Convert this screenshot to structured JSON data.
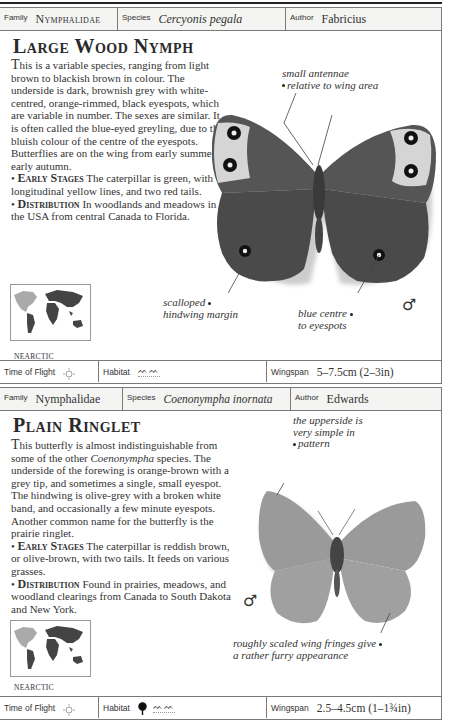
{
  "entries": [
    {
      "header": {
        "family_label": "Family",
        "family_value": "Nymphalidae",
        "species_label": "Species",
        "species_value": "Cercyonis pegala",
        "author_label": "Author",
        "author_value": "Fabricius"
      },
      "title": "Large Wood Nymph",
      "description": {
        "dropcap": "T",
        "text": "his is a variable species, ranging from light brown to blackish brown in colour. The underside is dark, brownish grey with white-centred, orange-rimmed, black eyespots, which are variable in number. The sexes are similar. It is often called the blue-eyed greyling, due to the bluish colour of the centre of the eyespots. Butterflies are on the wing from early summer to early autumn.",
        "early_stages_heading": "Early Stages",
        "early_stages_text": "The caterpillar is green, with longitudinal yellow lines, and two red tails.",
        "distribution_heading": "Distribution",
        "distribution_text": "In woodlands and meadows in the USA from central Canada to Florida."
      },
      "annotations": [
        {
          "text_line1": "small antennae",
          "text_line2": "relative to wing area"
        },
        {
          "text_line1": "scalloped",
          "text_line2": "hindwing margin"
        },
        {
          "text_line1": "blue centre",
          "text_line2": "to eyespots"
        }
      ],
      "sex_symbol": "♂",
      "map_region": "NEARCTIC",
      "footer": {
        "time_of_flight_label": "Time of Flight",
        "time_of_flight_icon": "sun-icon",
        "habitat_label": "Habitat",
        "habitat_icons": [
          "grassland-icon"
        ],
        "wingspan_label": "Wingspan",
        "wingspan_value": "5–7.5cm (2–3in)"
      }
    },
    {
      "header": {
        "family_label": "Family",
        "family_value": "Nymphalidae",
        "species_label": "Species",
        "species_value": "Coenonympha inornata",
        "author_label": "Author",
        "author_value": "Edwards"
      },
      "title": "Plain Ringlet",
      "description": {
        "dropcap": "T",
        "text_part1": "his butterfly is almost indistinguishable from some of the other ",
        "text_italic": "Coenonympha",
        "text_part2": " species. The underside of the forewing is orange-brown with a grey tip, and sometimes a single, small eyespot. The hindwing is olive-grey with a broken white band, and occasionally a few minute eyespots. Another common name for the butterfly is the prairie ringlet.",
        "early_stages_heading": "Early Stages",
        "early_stages_text": "The caterpillar is reddish brown, or olive-brown, with two tails. It feeds on various grasses.",
        "distribution_heading": "Distribution",
        "distribution_text": "Found in prairies, meadows, and woodland clearings from Canada to South Dakota and New York."
      },
      "annotations": [
        {
          "text_line1": "the upperside is",
          "text_line2": "very simple in",
          "text_line3": "pattern"
        },
        {
          "text_line1": "roughly scaled wing fringes give",
          "text_line2": "a rather furry appearance"
        }
      ],
      "sex_symbol": "♂",
      "map_region": "NEARCTIC",
      "footer": {
        "time_of_flight_label": "Time of Flight",
        "time_of_flight_icon": "sun-icon",
        "habitat_label": "Habitat",
        "habitat_icons": [
          "tree-icon",
          "grassland-icon"
        ],
        "wingspan_label": "Wingspan",
        "wingspan_value": "2.5–4.5cm (1–1¾in)"
      }
    }
  ]
}
